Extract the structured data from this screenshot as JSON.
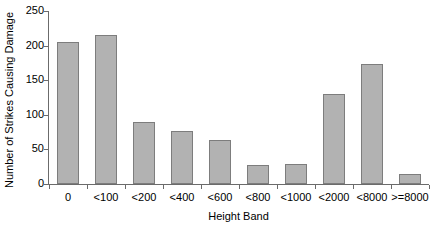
{
  "chart_data": {
    "type": "bar",
    "title": "",
    "xlabel": "Height Band",
    "ylabel": "Number of Strikes Causing Damage",
    "categories": [
      "0",
      "<100",
      "<200",
      "<400",
      "<600",
      "<800",
      "<1000",
      "<2000",
      "<8000",
      ">=8000"
    ],
    "values": [
      205,
      215,
      89,
      77,
      63,
      27,
      29,
      130,
      174,
      14
    ],
    "ylim": [
      0,
      250
    ],
    "yticks": [
      0,
      50,
      100,
      150,
      200,
      250
    ],
    "ytick_labels": [
      "0",
      "50",
      "100",
      "150",
      "200",
      "250"
    ],
    "grid": false,
    "legend": false,
    "legend_position": "none",
    "bar_fill_color": "#b2b2b2",
    "bar_edge_color": "#7d7d7d",
    "axis_color": "#6b6b6b",
    "background_color": "#ffffff"
  }
}
